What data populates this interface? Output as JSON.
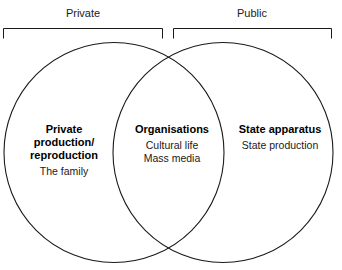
{
  "diagram": {
    "type": "venn",
    "title_labels": {
      "left": "Private",
      "right": "Public"
    },
    "stroke_color": "#1a1a1a",
    "background_color": "#ffffff",
    "regions": [
      {
        "id": "left-only",
        "title": "Private production/ reproduction",
        "title_line1": "Private",
        "title_line2": "production/",
        "title_line3": "reproduction",
        "items": [
          "The family"
        ]
      },
      {
        "id": "overlap",
        "title": "Organisations",
        "items": [
          "Cultural life",
          "Mass media"
        ]
      },
      {
        "id": "right-only",
        "title": "State apparatus",
        "items": [
          "State production"
        ]
      }
    ]
  }
}
